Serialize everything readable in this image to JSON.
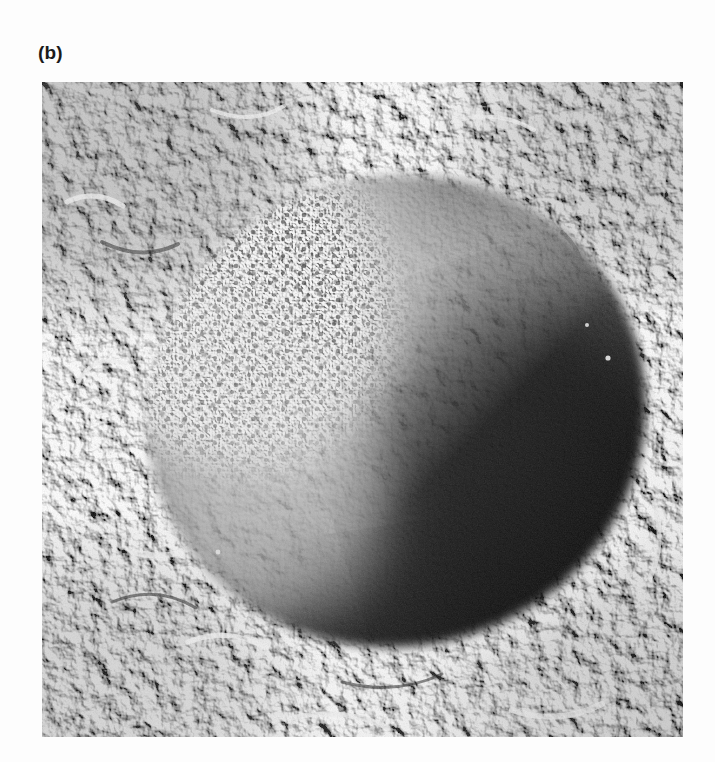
{
  "figure": {
    "panel_label": "(b)",
    "background_color": "#fdfdfd",
    "label_color": "#1b1b1b"
  },
  "micrograph": {
    "alt_text": "Freeze-fracture electron micrograph of a spherical organelle",
    "frame": {
      "x": 42,
      "y": 82,
      "width": 641,
      "height": 655
    },
    "modality": "freeze-fracture transmission electron micrograph",
    "palette": {
      "matrix_mid_gray": "#8d8d8d",
      "matrix_light": "#e8e8e8",
      "matrix_dark": "#2a2a2a",
      "body_dark": "#1d1d1d",
      "body_mid": "#6a6a6a",
      "particle_face_light": "#f2f2f2",
      "rim_highlight": "#f6f6f6",
      "shadow_deep": "#101010"
    },
    "features": {
      "central_body": {
        "name": "fractured-spherical-body",
        "center_x": 355,
        "center_y": 330,
        "radius_x": 258,
        "radius_y": 243,
        "rotation_deg": -14,
        "shading": "illuminated from upper-left, deep shadow toward lower-right"
      },
      "particle_face": {
        "name": "particle-studded-fracture-face",
        "center_x": 185,
        "center_y": 215,
        "radius_x": 150,
        "radius_y": 165,
        "description": "bright convex face studded with small dark intramembrane particles"
      },
      "rim_highlight": {
        "name": "shadow-rim-highlight",
        "description": "bright platinum-shadow rim along lower-right margin of the body"
      },
      "surrounding_matrix": {
        "name": "granular-matrix",
        "description": "rough high-contrast granular fractured matrix filling the periphery"
      }
    }
  }
}
